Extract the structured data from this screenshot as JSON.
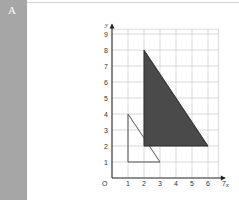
{
  "panel": {
    "label": "A"
  },
  "chart_data": {
    "type": "diagram-grid",
    "title": "",
    "xlabel": "x",
    "ylabel": "y",
    "origin_label": "O",
    "x_ticks": [
      "1",
      "2",
      "3",
      "4",
      "5",
      "6",
      "7"
    ],
    "y_ticks": [
      "1",
      "2",
      "3",
      "4",
      "5",
      "6",
      "7",
      "8",
      "9"
    ],
    "xlim": [
      0,
      7
    ],
    "ylim": [
      0,
      9
    ],
    "grid": true,
    "shapes": [
      {
        "name": "original-triangle",
        "fill": "none",
        "stroke": "#555555",
        "vertices": [
          [
            1,
            1
          ],
          [
            1,
            4
          ],
          [
            3,
            1
          ]
        ]
      },
      {
        "name": "enlarged-triangle",
        "fill": "#4a4a4a",
        "stroke": "#2a2a2a",
        "vertices": [
          [
            2,
            2
          ],
          [
            2,
            8
          ],
          [
            6,
            2
          ]
        ]
      }
    ]
  }
}
